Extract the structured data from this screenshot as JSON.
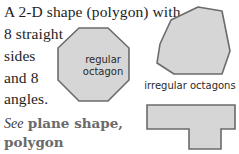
{
  "definition": {
    "lines": [
      "A 2-D shape (polygon) with",
      "8 straight",
      "sides",
      "and 8",
      "angles."
    ]
  },
  "figures": {
    "regular_octagon": {
      "label_line1": "regular",
      "label_line2": "octagon"
    },
    "irregular_octagons": {
      "caption": "irregular octagons"
    }
  },
  "see_also": {
    "prefix": "See",
    "refs_line1": "plane shape,",
    "refs_line2": "polygon"
  },
  "colors": {
    "shape_fill": "#d6d6d6",
    "shape_stroke": "#6b6b6b",
    "text": "#1e1e1e",
    "see_also_refs": "#6a6a6a"
  }
}
